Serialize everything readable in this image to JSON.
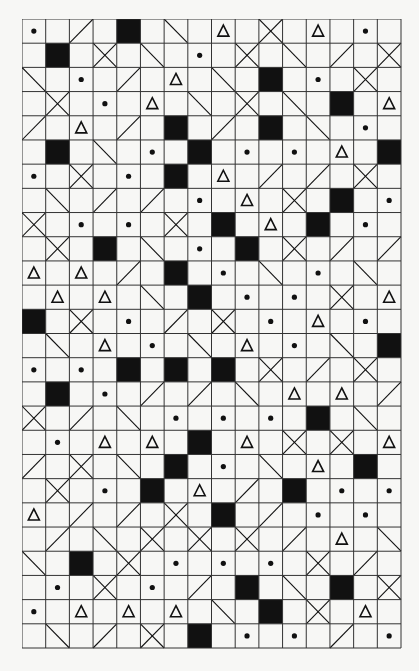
{
  "puzzle": {
    "title": "",
    "cols": 16,
    "rows": 26,
    "legend": {
      ".": "empty",
      "D": "dot",
      "T": "triangle",
      "B": "black-square",
      "/": "slash-forward",
      "\\": "slash-back",
      "X": "cross"
    },
    "colors": {
      "ink": "#111111",
      "paper": "#f7f7f5",
      "grid": "#333333"
    },
    "grid": [
      [
        "D",
        ".",
        "/",
        ".",
        "B",
        ".",
        "\\",
        ".",
        "T",
        ".",
        "X",
        ".",
        "T",
        ".",
        "D",
        "."
      ],
      [
        ".",
        "B",
        ".",
        "X",
        ".",
        "\\",
        ".",
        "D",
        ".",
        "X",
        ".",
        "\\",
        ".",
        "/",
        ".",
        "X"
      ],
      [
        "\\",
        ".",
        "D",
        ".",
        "/",
        ".",
        "T",
        ".",
        "\\",
        ".",
        "B",
        ".",
        "D",
        ".",
        "X",
        "."
      ],
      [
        ".",
        "X",
        ".",
        "D",
        ".",
        "T",
        ".",
        "\\",
        ".",
        "X",
        ".",
        "\\",
        ".",
        "B",
        ".",
        "T"
      ],
      [
        "/",
        ".",
        "T",
        ".",
        "/",
        ".",
        "B",
        ".",
        "/",
        ".",
        "B",
        ".",
        "\\",
        ".",
        "D",
        "."
      ],
      [
        ".",
        "B",
        ".",
        "\\",
        ".",
        "D",
        ".",
        "B",
        ".",
        "D",
        ".",
        "D",
        ".",
        "T",
        ".",
        "B"
      ],
      [
        "D",
        ".",
        "X",
        ".",
        "D",
        ".",
        "B",
        ".",
        "T",
        ".",
        "/",
        ".",
        "/",
        ".",
        "X",
        "."
      ],
      [
        ".",
        "\\",
        ".",
        "/",
        ".",
        "/",
        ".",
        "D",
        ".",
        "T",
        ".",
        "X",
        ".",
        "B",
        ".",
        "D"
      ],
      [
        "X",
        ".",
        "D",
        ".",
        "D",
        ".",
        "X",
        ".",
        "B",
        ".",
        "T",
        ".",
        "B",
        ".",
        "D",
        "."
      ],
      [
        ".",
        "X",
        ".",
        "B",
        ".",
        "\\",
        ".",
        "D",
        ".",
        "B",
        ".",
        "X",
        ".",
        "/",
        ".",
        "/"
      ],
      [
        "T",
        ".",
        "T",
        ".",
        "/",
        ".",
        "B",
        ".",
        "D",
        ".",
        "\\",
        ".",
        "D",
        ".",
        "\\",
        "."
      ],
      [
        ".",
        "T",
        ".",
        "T",
        ".",
        "\\",
        ".",
        "B",
        ".",
        "D",
        ".",
        "D",
        ".",
        "X",
        ".",
        "T"
      ],
      [
        "B",
        ".",
        "X",
        ".",
        "D",
        ".",
        "/",
        ".",
        "X",
        ".",
        "D",
        ".",
        "T",
        ".",
        "D",
        "."
      ],
      [
        ".",
        "\\",
        ".",
        "T",
        ".",
        "D",
        ".",
        "\\",
        ".",
        "T",
        ".",
        "D",
        ".",
        "\\",
        ".",
        "B"
      ],
      [
        "D",
        ".",
        "D",
        ".",
        "B",
        ".",
        "B",
        ".",
        "B",
        ".",
        "X",
        ".",
        "/",
        ".",
        "X",
        "."
      ],
      [
        ".",
        "B",
        ".",
        "D",
        ".",
        "/",
        ".",
        "/",
        ".",
        "\\",
        ".",
        "T",
        ".",
        "T",
        ".",
        "/"
      ],
      [
        "X",
        ".",
        "/",
        ".",
        "\\",
        ".",
        "D",
        ".",
        "D",
        ".",
        "D",
        ".",
        "B",
        ".",
        "\\",
        "."
      ],
      [
        ".",
        "D",
        ".",
        "T",
        ".",
        "T",
        ".",
        "B",
        ".",
        "T",
        ".",
        "X",
        ".",
        "X",
        ".",
        "T"
      ],
      [
        "/",
        ".",
        "X",
        ".",
        "\\",
        ".",
        "B",
        ".",
        "D",
        ".",
        "\\",
        ".",
        "T",
        ".",
        "B",
        "."
      ],
      [
        ".",
        "X",
        ".",
        "D",
        ".",
        "B",
        ".",
        "T",
        ".",
        "/",
        ".",
        "B",
        ".",
        "D",
        ".",
        "D"
      ],
      [
        "T",
        ".",
        "/",
        ".",
        "/",
        ".",
        "X",
        ".",
        "B",
        ".",
        "/",
        ".",
        "D",
        ".",
        "D",
        "."
      ],
      [
        ".",
        "/",
        ".",
        "\\",
        ".",
        "X",
        ".",
        "X",
        ".",
        "X",
        ".",
        "/",
        ".",
        "T",
        ".",
        "\\"
      ],
      [
        "\\",
        ".",
        "B",
        ".",
        "X",
        ".",
        "D",
        ".",
        "D",
        ".",
        "D",
        ".",
        "X",
        ".",
        "/",
        "."
      ],
      [
        ".",
        "D",
        ".",
        "X",
        ".",
        "D",
        ".",
        "/",
        ".",
        "B",
        ".",
        "\\",
        ".",
        "B",
        ".",
        "X"
      ],
      [
        "D",
        ".",
        "T",
        ".",
        "T",
        ".",
        "T",
        ".",
        "\\",
        ".",
        "B",
        ".",
        "X",
        ".",
        "T",
        "."
      ],
      [
        ".",
        "\\",
        ".",
        "/",
        ".",
        "X",
        ".",
        "B",
        ".",
        "D",
        ".",
        "D",
        ".",
        "/",
        ".",
        "D"
      ]
    ]
  }
}
